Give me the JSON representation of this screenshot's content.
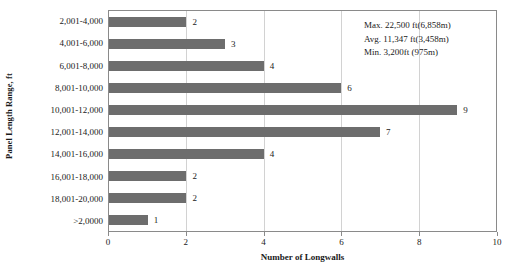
{
  "chart_data": {
    "type": "bar",
    "orientation": "horizontal",
    "title": "",
    "xlabel": "Number of Longwalls",
    "ylabel": "Panel Length Range, ft",
    "categories": [
      "2,001-4,000",
      "4,001-6,000",
      "6,001-8,000",
      "8,001-10,000",
      "10,001-12,000",
      "12,001-14,000",
      "14,001-16,000",
      "16,001-18,000",
      "18,001-20,000",
      ">2,0000"
    ],
    "values": [
      2,
      3,
      4,
      6,
      9,
      7,
      4,
      2,
      2,
      1
    ],
    "xlim": [
      0,
      10
    ],
    "xticks": [
      0,
      2,
      4,
      6,
      8,
      10
    ],
    "xtick_labels": [
      "0",
      "2",
      "4",
      "6",
      "8",
      "10"
    ],
    "grid": "vertical",
    "legend": "none",
    "bar_color": "#6d6d6d",
    "annotations": [
      "Max. 22,500 ft(6,858m)",
      "Avg. 11,347 ft(3,458m)",
      "Min. 3,200ft (975m)"
    ]
  }
}
